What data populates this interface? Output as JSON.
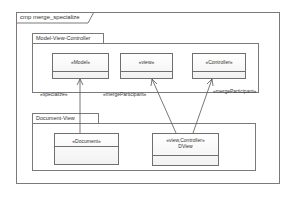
{
  "diagram": {
    "frame_label": "cmp merge_specialize",
    "packages": [
      {
        "name": "Model-View-Controller",
        "classes": [
          {
            "stereotype": "«Model»",
            "name": ""
          },
          {
            "stereotype": "«view»",
            "name": ""
          },
          {
            "stereotype": "«Controller»",
            "name": ""
          }
        ]
      },
      {
        "name": "Document-View",
        "classes": [
          {
            "stereotype": "«Document»",
            "name": ""
          },
          {
            "stereotype": "«view,Controller»",
            "name": "DView"
          }
        ]
      }
    ],
    "relations": [
      {
        "from": "«Document»",
        "to": "«Model»",
        "label": "«specialize»"
      },
      {
        "from": "DView",
        "to": "«view»",
        "label": "«mergeParticipant»"
      },
      {
        "from": "DView",
        "to": "«Controller»",
        "label": "«mergeParticipant»"
      }
    ],
    "colors": {
      "line": "#7a7a7a",
      "text": "#333333",
      "background": "#ffffff"
    }
  }
}
